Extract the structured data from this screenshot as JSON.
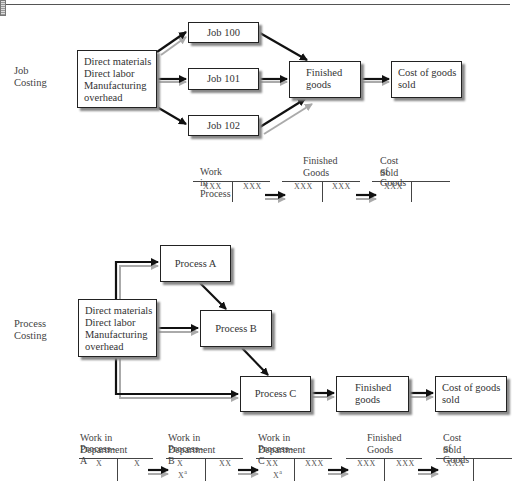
{
  "job_costing": {
    "label_line1": "Job",
    "label_line2": "Costing",
    "source_box": [
      "Direct materials",
      "Direct labor",
      "Manufacturing",
      "overhead"
    ],
    "jobs": [
      "Job 100",
      "Job 101",
      "Job 102"
    ],
    "finished_goods": [
      "Finished",
      "goods"
    ],
    "cogs": [
      "Cost of goods",
      "sold"
    ],
    "t_accounts": [
      {
        "title": [
          "Work in Process"
        ],
        "debit": "XXX",
        "credit": "XXX"
      },
      {
        "title": [
          "Finished",
          "Goods"
        ],
        "debit": "XXX",
        "credit": "XXX"
      },
      {
        "title": [
          "Cost of Goods",
          "Sold"
        ],
        "debit": "XXX",
        "credit": ""
      }
    ]
  },
  "process_costing": {
    "label_line1": "Process",
    "label_line2": "Costing",
    "source_box": [
      "Direct materials",
      "Direct labor",
      "Manufacturing",
      "overhead"
    ],
    "processes": [
      "Process A",
      "Process B",
      "Process C"
    ],
    "finished_goods": [
      "Finished",
      "goods"
    ],
    "cogs": [
      "Cost of goods",
      "sold"
    ],
    "t_accounts": [
      {
        "title": [
          "Work in Process–",
          "Department A"
        ],
        "debit": "X",
        "debit2": "",
        "credit": "X"
      },
      {
        "title": [
          "Work in Process–",
          "Department B"
        ],
        "debit": "X",
        "debit2": "X",
        "debit2_sup": "a",
        "credit": "XX"
      },
      {
        "title": [
          "Work in Process–",
          "Department C"
        ],
        "debit": "XX",
        "debit2": "X",
        "debit2_sup": "a",
        "credit": "XXX"
      },
      {
        "title": [
          "Finished",
          "Goods"
        ],
        "debit": "XXX",
        "debit2": "",
        "credit": "XXX"
      },
      {
        "title": [
          "Cost of Goods",
          "Sold"
        ],
        "debit": "XXX",
        "debit2": "",
        "credit": ""
      }
    ]
  }
}
